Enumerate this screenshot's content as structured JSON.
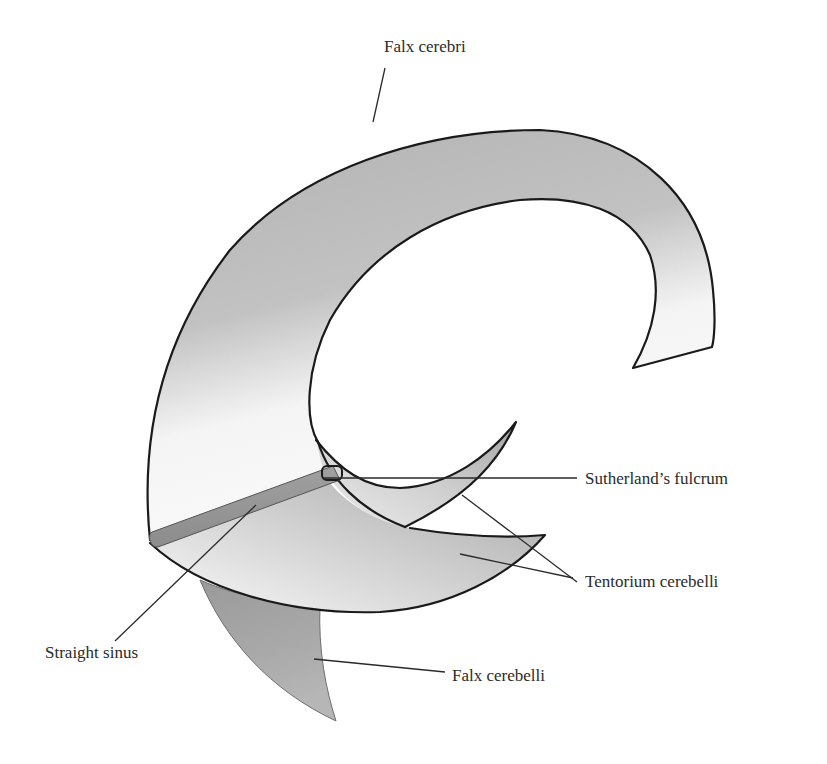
{
  "figure": {
    "structures": [
      {
        "id": "falx-cerebri",
        "label": "Falx cerebri"
      },
      {
        "id": "sutherlands-fulcrum",
        "label": "Sutherland’s fulcrum"
      },
      {
        "id": "tentorium-cerebelli",
        "label": "Tentorium cerebelli"
      },
      {
        "id": "straight-sinus",
        "label": "Straight sinus"
      },
      {
        "id": "falx-cerebelli",
        "label": "Falx cerebelli"
      }
    ],
    "colors": {
      "membrane_dark": "#a8a8a8",
      "membrane_mid": "#c4c4c4",
      "membrane_light": "#f6f6f6",
      "sinus": "#9a9a9a",
      "outline": "#1a1a1a",
      "text": "#2b2b2b",
      "background": "#ffffff"
    }
  },
  "labels": {
    "falx_cerebri": "Falx cerebri",
    "sutherlands_fulcrum": "Sutherland’s fulcrum",
    "tentorium_cerebelli": "Tentorium cerebelli",
    "straight_sinus": "Straight sinus",
    "falx_cerebelli": "Falx cerebelli"
  }
}
